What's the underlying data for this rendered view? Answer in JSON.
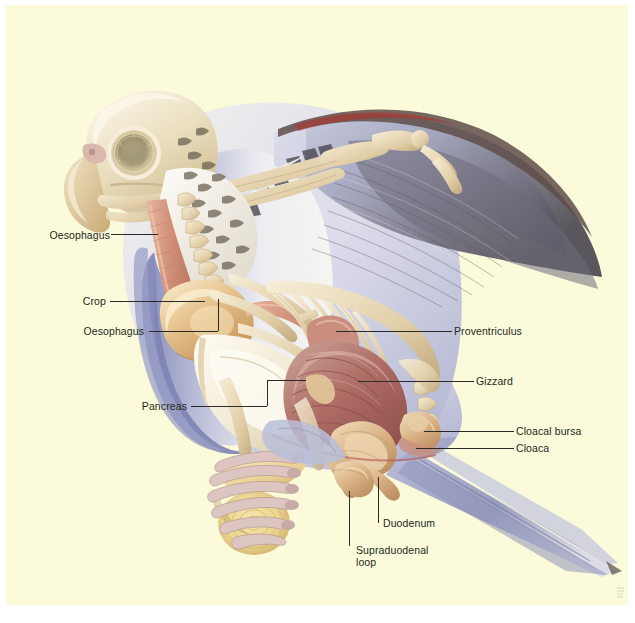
{
  "figure": {
    "kind": "anatomical-illustration",
    "background_color": "#fbfadb",
    "page_color": "#ffffff",
    "label_color": "#1d2b1a",
    "leader_color": "#2a2a2a"
  },
  "labels": [
    {
      "id": "oesophagus-neck",
      "text": "Oesophagus",
      "x": 36,
      "y": 231
    },
    {
      "id": "crop",
      "text": "Crop",
      "x": 75,
      "y": 296
    },
    {
      "id": "oesophagus-lower",
      "text": "Oesophagus",
      "x": 83,
      "y": 326
    },
    {
      "id": "pancreas",
      "text": "Pancreas",
      "x": 139,
      "y": 403
    },
    {
      "id": "proventriculus",
      "text": "Proventriculus",
      "x": 452,
      "y": 328
    },
    {
      "id": "gizzard",
      "text": "Gizzard",
      "x": 474,
      "y": 376
    },
    {
      "id": "cloacal-bursa",
      "text": "Cloacal bursa",
      "x": 514,
      "y": 428
    },
    {
      "id": "cloaca",
      "text": "Cloaca",
      "x": 514,
      "y": 445
    },
    {
      "id": "duodenum",
      "text": "Duodenum",
      "x": 381,
      "y": 520
    },
    {
      "id": "supraduodenal-loop",
      "text": "Supraduodenal\nloop",
      "x": 361,
      "y": 547
    }
  ],
  "palette": {
    "cream_bg": "#fbfadb",
    "bone": "#efe0c2",
    "bone_light": "#f8f0dd",
    "bone_shadow": "#d8c39a",
    "crop_gold": "#d9a963",
    "crop_gold_light": "#f2dcb0",
    "oesophagus_pink": "#d99d86",
    "gizzard_maroon": "#b26a63",
    "gizzard_dark": "#8e4f4c",
    "intestine_tan": "#ddb286",
    "feather_blue": "#9aa0c4",
    "feather_blue_dark": "#6d739e",
    "feather_grey": "#8e90a4",
    "wing_dark": "#55505c",
    "white_feather": "#f6f4f0",
    "perch_wood": "#efd9a0",
    "perch_wood_dark": "#c9a86a",
    "head_tan": "#ddc79a",
    "red_accent": "#a3373a"
  },
  "anatomy_parts": [
    "skull",
    "eye-ring",
    "beak",
    "cervical-vertebrae",
    "oesophagus",
    "crop",
    "furcula",
    "sternum-keel",
    "ribs",
    "proventriculus",
    "gizzard",
    "duodenum",
    "supraduodenal-loop",
    "pancreas",
    "intestines",
    "cloaca",
    "cloacal-bursa",
    "wing-bones",
    "primary-feathers",
    "secondary-feathers",
    "tail-feathers",
    "leg-bones",
    "foot-talons",
    "wooden-perch"
  ]
}
